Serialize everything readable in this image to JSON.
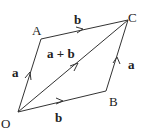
{
  "diagram": {
    "type": "vector-parallelogram",
    "points": {
      "O": {
        "label": "O",
        "x": 18,
        "y": 112
      },
      "A": {
        "label": "A",
        "x": 41,
        "y": 39
      },
      "C": {
        "label": "C",
        "x": 128,
        "y": 20
      },
      "B": {
        "label": "B",
        "x": 106,
        "y": 91
      }
    },
    "edges": [
      {
        "from": "O",
        "to": "A",
        "label": "a"
      },
      {
        "from": "A",
        "to": "C",
        "label": "b"
      },
      {
        "from": "O",
        "to": "B",
        "label": "b"
      },
      {
        "from": "B",
        "to": "C",
        "label": "a"
      },
      {
        "from": "O",
        "to": "C",
        "label": "a + b"
      }
    ],
    "stroke_color": "#333333"
  }
}
